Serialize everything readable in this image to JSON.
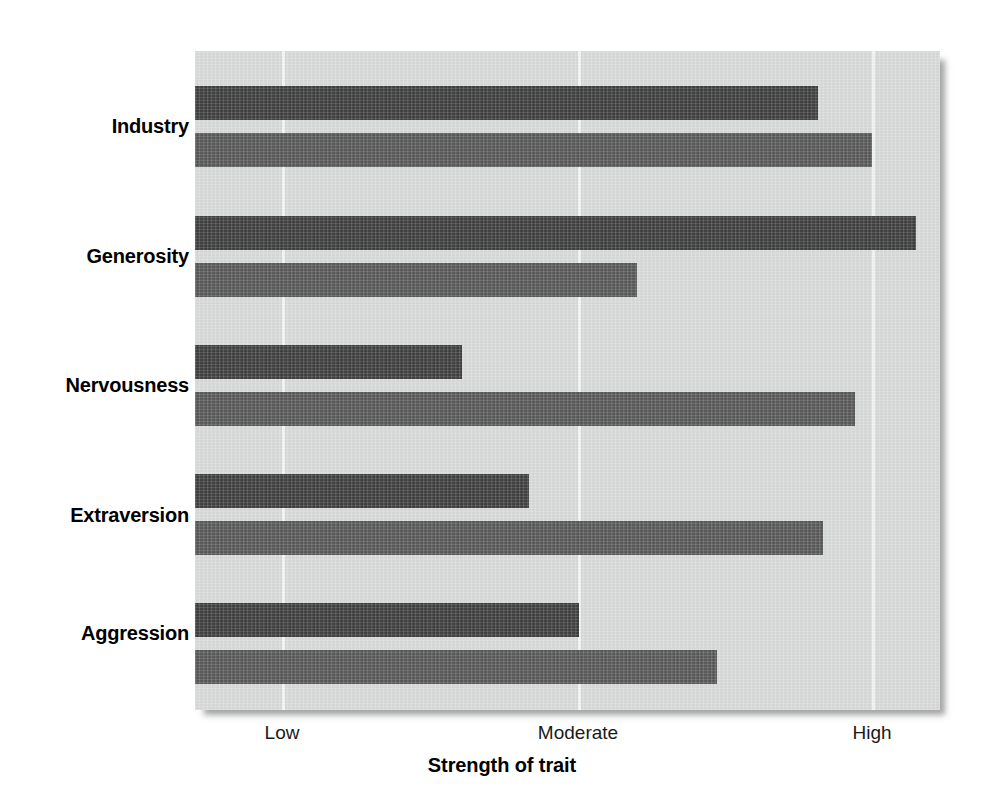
{
  "chart_data": {
    "type": "bar",
    "orientation": "horizontal",
    "title": "",
    "subtitle": "",
    "xlabel": "Strength of trait",
    "ylabel": "",
    "categories": [
      "Industry",
      "Generosity",
      "Nervousness",
      "Extraversion",
      "Aggression"
    ],
    "x_tick_labels": [
      "Low",
      "Moderate",
      "High"
    ],
    "x_tick_values": [
      1,
      2,
      3
    ],
    "xlim": [
      0.705,
      3.23
    ],
    "grid": "vertical gridlines at Low, Moderate, High",
    "legend": "none",
    "series": [
      {
        "name": "dark-series",
        "color": "#3a3a3a",
        "values": [
          2.82,
          3.15,
          1.61,
          1.84,
          2.0
        ]
      },
      {
        "name": "light-series",
        "color": "#565656",
        "values": [
          3.0,
          2.2,
          2.94,
          2.84,
          2.47
        ]
      }
    ],
    "bars": [
      {
        "category": "Industry",
        "series": "dark-series",
        "value": 2.82,
        "top": 86,
        "end_px": 818
      },
      {
        "category": "Industry",
        "series": "light-series",
        "value": 3.0,
        "top": 133,
        "end_px": 872
      },
      {
        "category": "Generosity",
        "series": "dark-series",
        "value": 3.15,
        "top": 216,
        "end_px": 916
      },
      {
        "category": "Generosity",
        "series": "light-series",
        "value": 2.2,
        "top": 263,
        "end_px": 637
      },
      {
        "category": "Nervousness",
        "series": "dark-series",
        "value": 1.61,
        "top": 345,
        "end_px": 462
      },
      {
        "category": "Nervousness",
        "series": "light-series",
        "value": 2.94,
        "top": 392,
        "end_px": 855
      },
      {
        "category": "Extraversion",
        "series": "dark-series",
        "value": 1.84,
        "top": 474,
        "end_px": 529
      },
      {
        "category": "Extraversion",
        "series": "light-series",
        "value": 2.84,
        "top": 521,
        "end_px": 823
      },
      {
        "category": "Aggression",
        "series": "dark-series",
        "value": 2.0,
        "top": 603,
        "end_px": 579
      },
      {
        "category": "Aggression",
        "series": "light-series",
        "value": 2.47,
        "top": 650,
        "end_px": 717
      }
    ]
  },
  "layout": {
    "plot_left_px": 195,
    "plot_top_px": 51,
    "plot_width_px": 745,
    "plot_height_px": 659,
    "gridline_x_px": [
      282,
      578,
      872
    ],
    "bar_height_px": 34,
    "panel_color": "#d8d9d9",
    "gridline_color": "#f2f3f3",
    "dark_bar_color": "#3a3a3a",
    "light_bar_color": "#565656",
    "label_color": "#000000",
    "background_color": "#ffffff"
  },
  "category_label_tops": [
    115,
    245,
    374,
    504,
    622
  ]
}
